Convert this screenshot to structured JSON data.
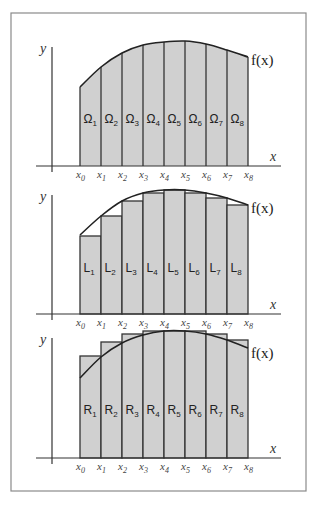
{
  "figure": {
    "frame": {
      "x": 11,
      "y": 13,
      "w": 295,
      "h": 478
    },
    "bar_fill": "#d0d0d0",
    "stroke": "#333333",
    "x_positions": [
      80,
      101,
      122,
      143,
      164,
      185,
      206,
      227,
      248
    ],
    "tick_labels": [
      "x",
      "x",
      "x",
      "x",
      "x",
      "x",
      "x",
      "x",
      "x"
    ],
    "tick_subs": [
      "0",
      "1",
      "2",
      "3",
      "4",
      "5",
      "6",
      "7",
      "8"
    ]
  },
  "panels": [
    {
      "name": "exact-area",
      "type": "area",
      "y_axis_label": "y",
      "x_axis_label": "x",
      "function_label": "f(x)",
      "axis_y": 166,
      "y_axis_top": 47,
      "curve_y": [
        87,
        67,
        53,
        45,
        42,
        41,
        44,
        50,
        57
      ],
      "bar_tops": [],
      "region_prefix": "Ω",
      "regions": [
        "1",
        "2",
        "3",
        "4",
        "5",
        "6",
        "7",
        "8"
      ],
      "label_y": 123
    },
    {
      "name": "lower-sum",
      "type": "lower",
      "y_axis_label": "y",
      "x_axis_label": "x",
      "function_label": "f(x)",
      "axis_y": 314,
      "y_axis_top": 195,
      "curve_y": [
        235,
        216,
        201,
        193,
        190,
        190,
        193,
        198,
        205
      ],
      "bar_tops": [
        236,
        216,
        201,
        193,
        190,
        193,
        198,
        205
      ],
      "region_prefix": "L",
      "regions": [
        "1",
        "2",
        "3",
        "4",
        "5",
        "6",
        "7",
        "8"
      ],
      "label_y": 272
    },
    {
      "name": "upper-sum",
      "type": "upper",
      "y_axis_label": "y",
      "x_axis_label": "x",
      "function_label": "f(x)",
      "axis_y": 458,
      "y_axis_top": 338,
      "curve_y": [
        378,
        357,
        343,
        335,
        331,
        331,
        334,
        340,
        348
      ],
      "bar_tops": [
        356,
        342,
        334,
        331,
        331,
        331,
        334,
        340
      ],
      "region_prefix": "R",
      "regions": [
        "1",
        "2",
        "3",
        "4",
        "5",
        "6",
        "7",
        "8"
      ],
      "label_y": 414
    }
  ]
}
